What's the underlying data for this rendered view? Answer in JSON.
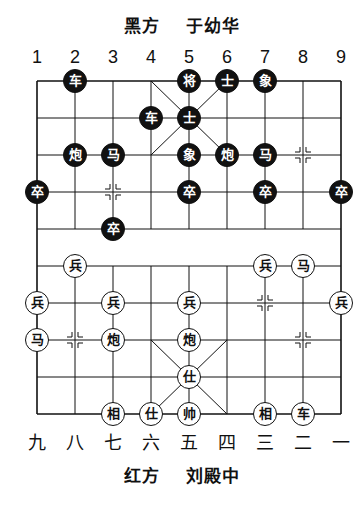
{
  "header": {
    "side_label": "黑方",
    "player": "于幼华"
  },
  "footer": {
    "side_label": "红方",
    "player": "刘殿中"
  },
  "top_files": [
    "1",
    "2",
    "3",
    "4",
    "5",
    "6",
    "7",
    "8",
    "9"
  ],
  "bottom_files": [
    "九",
    "八",
    "七",
    "六",
    "五",
    "四",
    "三",
    "二",
    "一"
  ],
  "board": {
    "origin_x": 37,
    "origin_y": 81,
    "col_spacing": 38,
    "row_spacing": 37,
    "line_color": "#111111",
    "markers": [
      [
        8,
        2
      ],
      [
        3,
        3
      ],
      [
        7,
        6
      ],
      [
        2,
        7
      ],
      [
        8,
        7
      ]
    ]
  },
  "pieces": {
    "black": [
      {
        "glyph": "车",
        "col": 2,
        "row": 0
      },
      {
        "glyph": "将",
        "col": 5,
        "row": 0
      },
      {
        "glyph": "士",
        "col": 6,
        "row": 0
      },
      {
        "glyph": "象",
        "col": 7,
        "row": 0
      },
      {
        "glyph": "车",
        "col": 4,
        "row": 1
      },
      {
        "glyph": "士",
        "col": 5,
        "row": 1
      },
      {
        "glyph": "炮",
        "col": 2,
        "row": 2
      },
      {
        "glyph": "马",
        "col": 3,
        "row": 2
      },
      {
        "glyph": "象",
        "col": 5,
        "row": 2
      },
      {
        "glyph": "炮",
        "col": 6,
        "row": 2
      },
      {
        "glyph": "马",
        "col": 7,
        "row": 2
      },
      {
        "glyph": "卒",
        "col": 1,
        "row": 3
      },
      {
        "glyph": "卒",
        "col": 5,
        "row": 3
      },
      {
        "glyph": "卒",
        "col": 7,
        "row": 3
      },
      {
        "glyph": "卒",
        "col": 9,
        "row": 3
      },
      {
        "glyph": "卒",
        "col": 3,
        "row": 4
      }
    ],
    "red": [
      {
        "glyph": "兵",
        "col": 2,
        "row": 5
      },
      {
        "glyph": "兵",
        "col": 7,
        "row": 5
      },
      {
        "glyph": "马",
        "col": 8,
        "row": 5
      },
      {
        "glyph": "兵",
        "col": 1,
        "row": 6
      },
      {
        "glyph": "兵",
        "col": 3,
        "row": 6
      },
      {
        "glyph": "兵",
        "col": 5,
        "row": 6
      },
      {
        "glyph": "兵",
        "col": 9,
        "row": 6
      },
      {
        "glyph": "马",
        "col": 1,
        "row": 7
      },
      {
        "glyph": "炮",
        "col": 3,
        "row": 7
      },
      {
        "glyph": "炮",
        "col": 5,
        "row": 7
      },
      {
        "glyph": "仕",
        "col": 5,
        "row": 8
      },
      {
        "glyph": "相",
        "col": 3,
        "row": 9
      },
      {
        "glyph": "仕",
        "col": 4,
        "row": 9
      },
      {
        "glyph": "帅",
        "col": 5,
        "row": 9
      },
      {
        "glyph": "相",
        "col": 7,
        "row": 9
      },
      {
        "glyph": "车",
        "col": 8,
        "row": 9
      }
    ]
  }
}
